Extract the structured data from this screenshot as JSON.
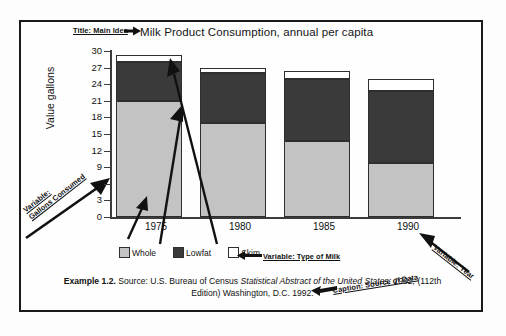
{
  "figure": {
    "title": "Milk Product Consumption, annual per capita",
    "caption": {
      "example_label": "Example 1.2.",
      "source_prefix": " Source: U.S. Bureau of Census ",
      "source_italic": "Statistical Abstract of the United States: 1992,",
      "source_suffix": " (112th Edition) Washington, D.C. 1992."
    }
  },
  "annotations": {
    "title_annotation": "Title: Main Idea",
    "y_variable_annotation_line1": "Variable:",
    "y_variable_annotation_line2": "Gallons Consumed",
    "series_annotation": "Variable: Type of Milk",
    "x_variable_annotation": "Variable: Year",
    "caption_annotation": "Caption: Source of Data"
  },
  "legend": {
    "position": "bottom-left",
    "items": [
      {
        "label": "Whole",
        "color": "#c3c3c3",
        "icon": "square-swatch-icon"
      },
      {
        "label": "Lowfat",
        "color": "#3a3a3a",
        "icon": "square-swatch-icon"
      },
      {
        "label": "Skim",
        "color": "#ffffff",
        "icon": "square-swatch-icon"
      }
    ]
  },
  "chart_data": {
    "type": "bar",
    "stacked": true,
    "title": "Milk Product Consumption, annual per capita",
    "xlabel": "",
    "ylabel": "Value gallons",
    "categories": [
      "1975",
      "1980",
      "1985",
      "1990"
    ],
    "ylim": [
      0,
      30
    ],
    "yticks": [
      0,
      3,
      6,
      9,
      12,
      15,
      18,
      21,
      24,
      27,
      30
    ],
    "ytick_labels": [
      "0",
      "3",
      "6",
      "9",
      "12",
      "15",
      "18",
      "21",
      "24",
      "27",
      "30"
    ],
    "grid": false,
    "legend_position": "below-axis-left",
    "series": [
      {
        "name": "Whole",
        "color": "#c3c3c3",
        "values": [
          21.0,
          17.0,
          13.7,
          9.7
        ]
      },
      {
        "name": "Lowfat",
        "color": "#3a3a3a",
        "values": [
          7.0,
          9.0,
          11.3,
          13.1
        ]
      },
      {
        "name": "Skim",
        "color": "#ffffff",
        "values": [
          1.3,
          1.0,
          1.3,
          2.2
        ]
      }
    ],
    "totals": [
      29.3,
      27.0,
      26.3,
      25.0
    ]
  }
}
